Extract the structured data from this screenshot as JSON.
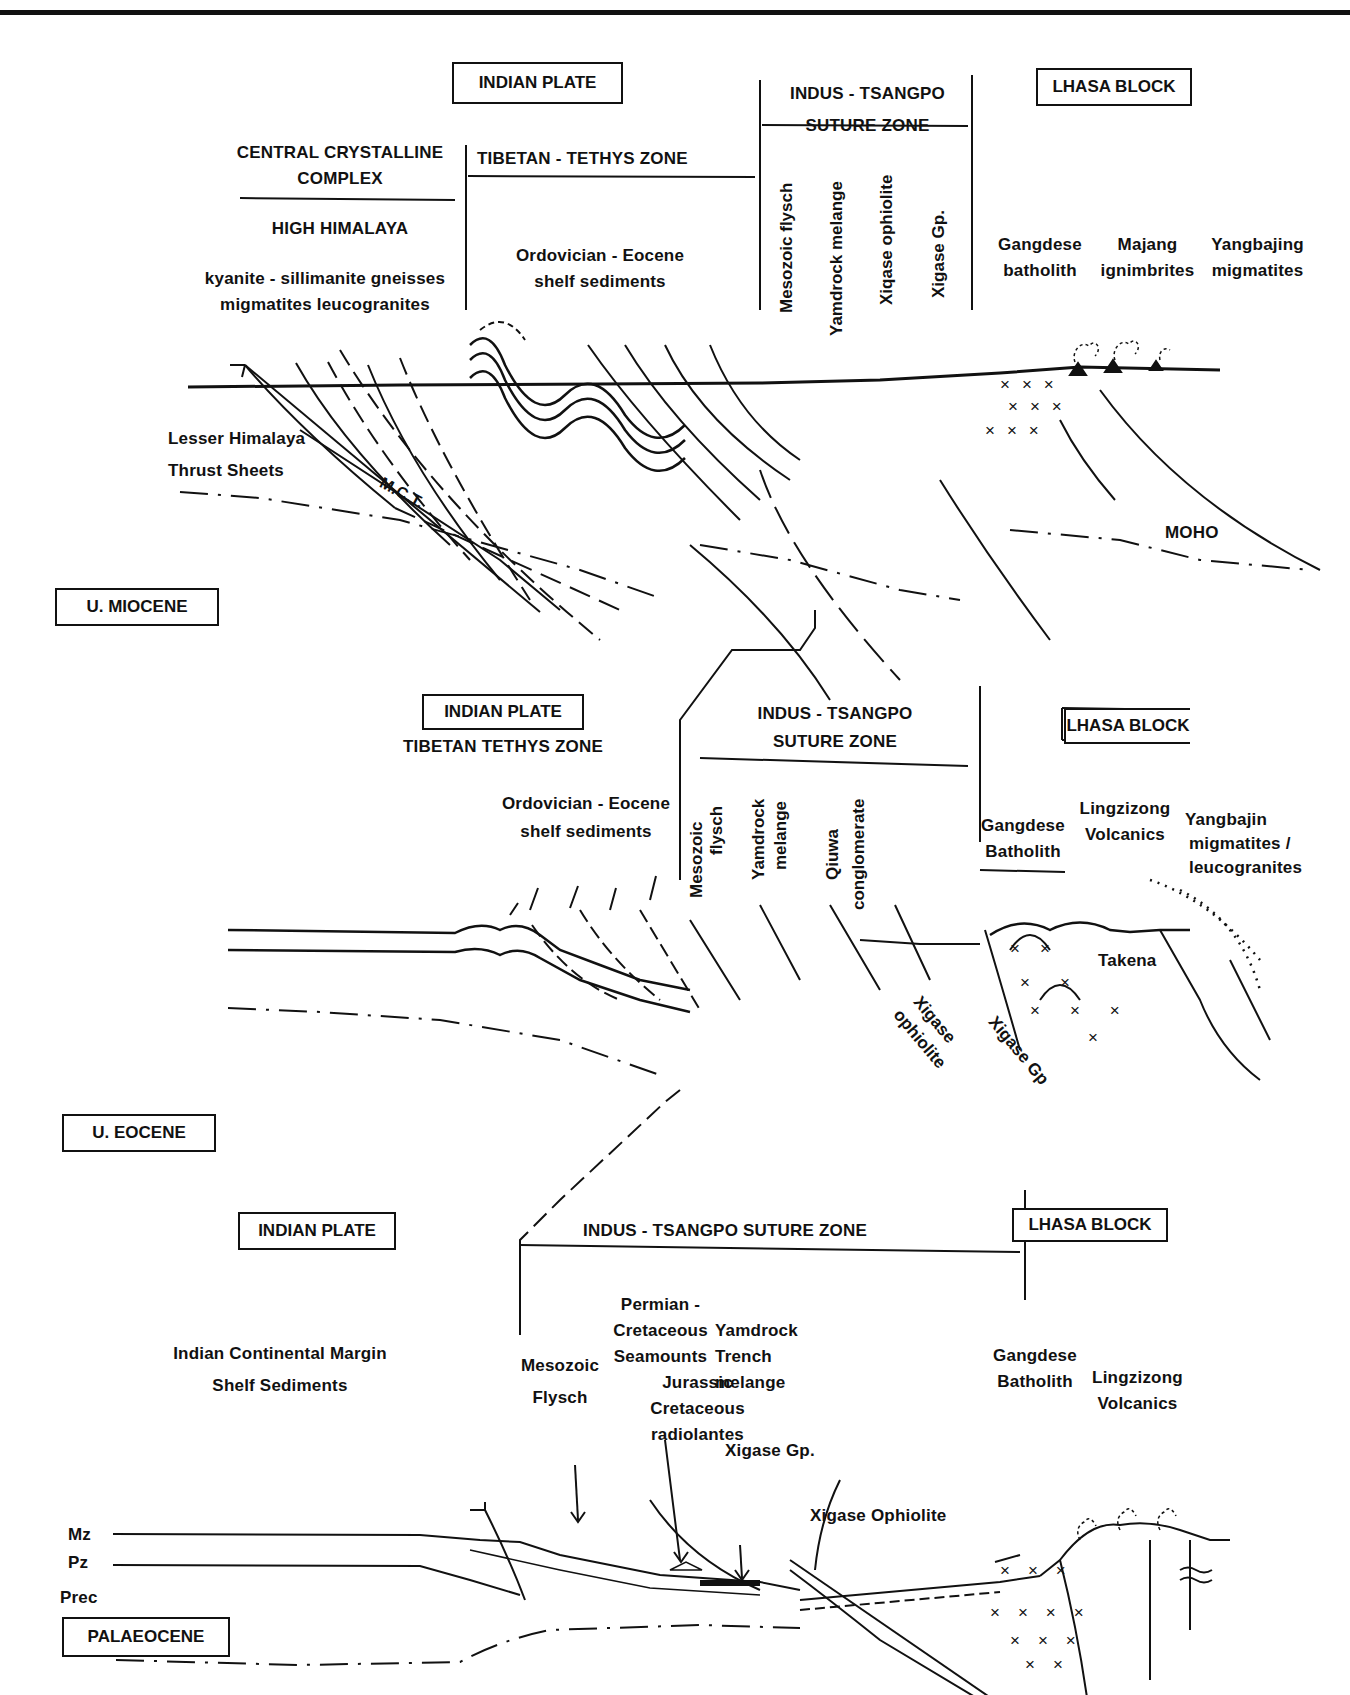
{
  "figure": {
    "panels": [
      {
        "age": "U. MIOCENE",
        "zones": {
          "indian_plate": "INDIAN PLATE",
          "central_crystalline": [
            "CENTRAL CRYSTALLINE",
            "COMPLEX"
          ],
          "high_himalaya": "HIGH HIMALAYA",
          "high_himalaya_rocks": [
            "kyanite -  sillimanite gneisses",
            "migmatites  leucogranites"
          ],
          "tibetan_tethys": "TIBETAN - TETHYS ZONE",
          "tethys_rocks": [
            "Ordovician -  Eocene",
            "shelf sediments"
          ],
          "suture": [
            "INDUS - TSANGPO",
            "SUTURE ZONE"
          ],
          "suture_units": [
            "Mesozoic  flysch",
            "Yamdrock  melange",
            "Xiqase ophiolite",
            "Xigase Gp."
          ],
          "lhasa": "LHASA BLOCK",
          "lhasa_units": [
            [
              "Gangdese",
              "batholith"
            ],
            [
              "Majang",
              "ignimbrites"
            ],
            [
              "Yangbajing",
              "migmatites"
            ]
          ]
        },
        "annotations": {
          "lesser_himalaya": [
            "Lesser Himalaya",
            "Thrust Sheets"
          ],
          "mct": "M.C.T.",
          "moho": "MOHO"
        }
      },
      {
        "age": "U. EOCENE",
        "zones": {
          "indian_plate": "INDIAN PLATE",
          "tibetan_tethys": "TIBETAN TETHYS ZONE",
          "tethys_rocks": [
            "Ordovician - Eocene",
            "shelf sediments"
          ],
          "suture": [
            "INDUS - TSANGPO",
            "SUTURE  ZONE"
          ],
          "suture_units": [
            [
              "Mesozoic",
              "flysch"
            ],
            [
              "Yamdrock",
              "melange"
            ],
            [
              "Qiuwa",
              "conglomerate"
            ]
          ],
          "lhasa": "LHASA BLOCK",
          "lhasa_units": [
            [
              "Gangdese",
              "Batholith"
            ],
            [
              "Lingzizong",
              "Volcanics"
            ],
            [
              "Yangbajin",
              "migmatites /",
              "leucogranites"
            ]
          ]
        },
        "annotations": {
          "takena": "Takena",
          "xigase_ophiolite": [
            "Xigase",
            "ophiolite"
          ],
          "xigase_gp": "Xigase  Gp"
        }
      },
      {
        "age": "PALAEOCENE",
        "zones": {
          "indian_plate": "INDIAN  PLATE",
          "suture": "INDUS - TSANGPO SUTURE ZONE",
          "lhasa": "LHASA  BLOCK"
        },
        "annotations": {
          "indian_margin": [
            "Indian Continental Margin",
            "Shelf Sediments"
          ],
          "mesozoic_flysch": [
            "Mesozoic",
            "Flysch"
          ],
          "seamounts": [
            "Permian -",
            "Cretaceous",
            "Seamounts"
          ],
          "radiolarites": [
            "Jurassic",
            "Cretaceous",
            "radiolantes"
          ],
          "yamdrock": [
            "Yamdrock",
            "Trench",
            "melange"
          ],
          "xigase_gp": "Xigase Gp.",
          "xigase_ophiolite": "Xigase Ophiolite",
          "gangdese": [
            "Gangdese",
            "Batholith"
          ],
          "lingzizong": [
            "Lingzizong",
            "Volcanics"
          ],
          "strata": [
            "Mz",
            "Pz",
            "Prec"
          ]
        }
      }
    ]
  }
}
